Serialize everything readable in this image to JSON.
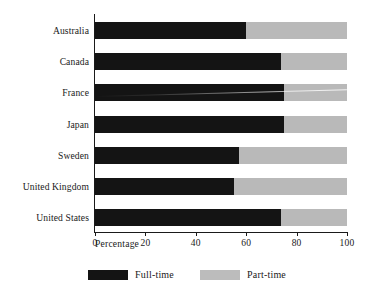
{
  "chart_data": {
    "type": "bar",
    "orientation": "horizontal",
    "stacked": true,
    "title": "",
    "xlabel": "Percentage",
    "ylabel": "",
    "xlim": [
      0,
      100
    ],
    "xticks": [
      0,
      20,
      40,
      60,
      80,
      100
    ],
    "xtick_labels": [
      "0",
      "20",
      "40",
      "60",
      "80",
      "100"
    ],
    "grid": false,
    "legend_position": "bottom-center",
    "categories": [
      "Australia",
      "Canada",
      "France",
      "Japan",
      "Sweden",
      "United Kingdom",
      "United States"
    ],
    "series": [
      {
        "name": "Full-time",
        "color": "#141414",
        "values": [
          60,
          74,
          75,
          75,
          57,
          55,
          74
        ]
      },
      {
        "name": "Part-time",
        "color": "#b9b9b9",
        "values": [
          40,
          26,
          25,
          25,
          43,
          45,
          26
        ]
      }
    ]
  },
  "legend": {
    "items": [
      {
        "label": "Full-time",
        "swatch": "full-time-swatch"
      },
      {
        "label": "Part-time",
        "swatch": "part-time-swatch"
      }
    ]
  },
  "colors": {
    "full_time": "#141414",
    "part_time": "#b9b9b9",
    "axis": "#1a1a1a",
    "background": "#ffffff"
  }
}
